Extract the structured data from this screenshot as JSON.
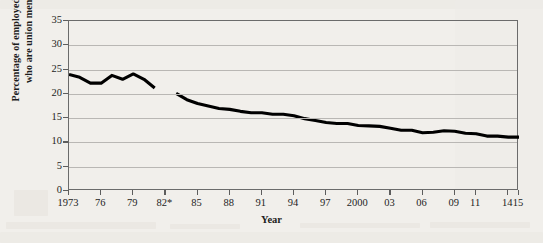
{
  "chart_data": {
    "type": "line",
    "title": "",
    "xlabel": "Year",
    "ylabel": "Percentage of employed workers who are union members",
    "ylabel_lines": [
      "Percentage of employed workers",
      "who are union members"
    ],
    "xlim": [
      1973,
      2015
    ],
    "ylim": [
      0,
      35
    ],
    "y_ticks": [
      0,
      5,
      10,
      15,
      20,
      25,
      30,
      35
    ],
    "x_tick_labels": [
      "1973",
      "76",
      "79",
      "82*",
      "85",
      "88",
      "91",
      "94",
      "97",
      "2000",
      "03",
      "06",
      "09",
      "11",
      "14",
      "15"
    ],
    "x_tick_years": [
      1973,
      1976,
      1979,
      1982,
      1985,
      1988,
      1991,
      1994,
      1997,
      2000,
      2003,
      2006,
      2009,
      2011,
      2014,
      2015
    ],
    "grid": "horizontal",
    "legend": "none",
    "note": "Series break at 1982 (asterisk denotes change in measurement series)",
    "series": [
      {
        "name": "Union membership rate (1973-1981 series)",
        "color": "#000000",
        "x": [
          1973,
          1974,
          1975,
          1976,
          1977,
          1978,
          1979,
          1980,
          1981
        ],
        "values": [
          24.0,
          23.4,
          22.2,
          22.2,
          23.8,
          23.0,
          24.1,
          23.0,
          21.2
        ]
      },
      {
        "name": "Union membership rate (1983-2015 series)",
        "color": "#000000",
        "x": [
          1983,
          1984,
          1985,
          1986,
          1987,
          1988,
          1989,
          1990,
          1991,
          1992,
          1993,
          1994,
          1995,
          1996,
          1997,
          1998,
          1999,
          2000,
          2001,
          2002,
          2003,
          2004,
          2005,
          2006,
          2007,
          2008,
          2009,
          2010,
          2011,
          2012,
          2013,
          2014,
          2015
        ],
        "values": [
          20.1,
          18.8,
          18.0,
          17.5,
          17.0,
          16.8,
          16.4,
          16.1,
          16.1,
          15.8,
          15.8,
          15.5,
          14.9,
          14.5,
          14.1,
          13.9,
          13.9,
          13.5,
          13.4,
          13.3,
          12.9,
          12.5,
          12.5,
          12.0,
          12.1,
          12.4,
          12.3,
          11.9,
          11.8,
          11.3,
          11.3,
          11.1,
          11.1
        ]
      }
    ]
  },
  "axis": {
    "x_title": "Year"
  }
}
